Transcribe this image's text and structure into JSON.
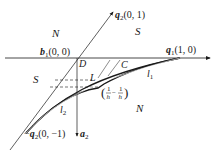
{
  "diagram": {
    "type": "geometric-vector-diagram",
    "points": {
      "b1": {
        "name": "b",
        "sub": "1",
        "coords": "(0, 0)"
      },
      "q1": {
        "name": "q",
        "sub": "1",
        "coords": "(1, 0)"
      },
      "q2": {
        "name": "q",
        "sub": "2",
        "coords": "(0, 1)"
      },
      "neg_q2": {
        "prefix": "−",
        "name": "q",
        "sub": "2",
        "coords": "(0, −1)"
      },
      "a2": {
        "name": "a",
        "sub": "2"
      },
      "D": "D",
      "C": "C",
      "L": "L",
      "h_point": {
        "open": "(",
        "num1": "1",
        "den1": "h",
        "sep": ", −",
        "num2": "1",
        "den2": "h",
        "close": ")"
      }
    },
    "curves": {
      "l1": {
        "name": "l",
        "sub": "1"
      },
      "l2": {
        "name": "l",
        "sub": "2"
      }
    },
    "regions": {
      "N_top": "N",
      "S_top": "S",
      "S_left": "S",
      "N_bottom": "N"
    },
    "colors": {
      "line": "#1a1a1a",
      "background": "#ffffff"
    }
  }
}
